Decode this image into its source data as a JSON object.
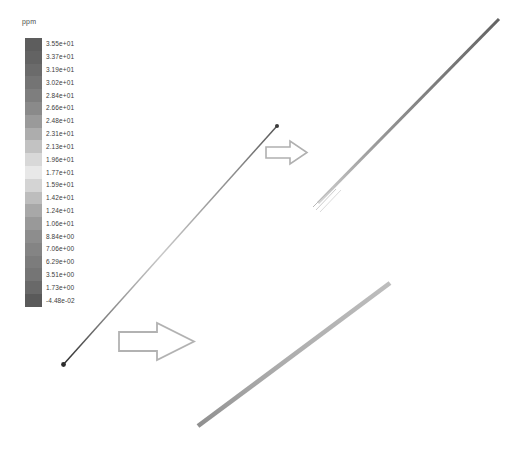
{
  "legend": {
    "unit_label": "ppm",
    "tick_labels": [
      "3.55e+01",
      "3.37e+01",
      "3.19e+01",
      "3.02e+01",
      "2.84e+01",
      "2.66e+01",
      "2.48e+01",
      "2.31e+01",
      "2.13e+01",
      "1.96e+01",
      "1.77e+01",
      "1.59e+01",
      "1.42e+01",
      "1.24e+01",
      "1.06e+01",
      "8.84e+00",
      "7.06e+00",
      "6.29e+00",
      "3.51e+00",
      "1.73e+00",
      "-4.48e-02"
    ]
  },
  "annotations": {
    "arrow_upper_name": "magnify-arrow-upper",
    "arrow_lower_name": "magnify-arrow-lower"
  },
  "chart_data": {
    "type": "heatmap",
    "title": "",
    "subtitle": "",
    "xlabel": "",
    "ylabel": "",
    "colorbar_label": "ppm",
    "colorbar_units": "ppm",
    "grid": false,
    "legend_position": "left",
    "colormap": "grayscale-rainbow",
    "value_min": -0.0448,
    "value_max": 35.5,
    "colorbar_ticks": [
      35.5,
      33.7,
      31.9,
      30.2,
      28.4,
      26.6,
      24.8,
      23.1,
      21.3,
      19.6,
      17.7,
      15.9,
      14.2,
      12.4,
      10.6,
      8.84,
      7.06,
      6.29,
      3.51,
      1.73,
      -0.0448
    ],
    "colorbar_tick_labels": [
      "3.55e+01",
      "3.37e+01",
      "3.19e+01",
      "3.02e+01",
      "2.84e+01",
      "2.66e+01",
      "2.48e+01",
      "2.31e+01",
      "2.13e+01",
      "1.96e+01",
      "1.77e+01",
      "1.59e+01",
      "1.42e+01",
      "1.24e+01",
      "1.06e+01",
      "8.84e+00",
      "7.06e+00",
      "6.29e+00",
      "3.51e+00",
      "1.73e+00",
      "-4.48e-02"
    ],
    "colorbar_swatches": [
      "#5d5d5d",
      "#636363",
      "#6b6b6b",
      "#747474",
      "#7e7e7e",
      "#8a8a8a",
      "#9a9a9a",
      "#adadad",
      "#c2c2c2",
      "#d8d8d8",
      "#e8e8e8",
      "#d4d4d4",
      "#bdbdbd",
      "#a8a8a8",
      "#999999",
      "#8d8d8d",
      "#848484",
      "#7c7c7c",
      "#757575",
      "#696969",
      "#5a5a5a"
    ],
    "series": [
      {
        "name": "probe-line-main",
        "role": "sampling line with endpoint markers",
        "x": [
          63,
          277
        ],
        "y": [
          365,
          126
        ],
        "marker": "dot"
      },
      {
        "name": "magnified-band-upper",
        "role": "enlarged contour strip of the sampling line",
        "x": [
          317,
          499
        ],
        "y": [
          202,
          19
        ],
        "thickness": 3
      },
      {
        "name": "magnified-band-lower",
        "role": "enlarged contour strip of the sampling line",
        "x": [
          198,
          390
        ],
        "y": [
          425,
          283
        ],
        "thickness": 5
      }
    ],
    "annotations": [
      {
        "type": "arrow",
        "name": "magnify-arrow-upper",
        "x": 265,
        "y": 152,
        "direction": "right"
      },
      {
        "type": "arrow",
        "name": "magnify-arrow-lower",
        "x": 120,
        "y": 341,
        "direction": "right"
      }
    ]
  }
}
